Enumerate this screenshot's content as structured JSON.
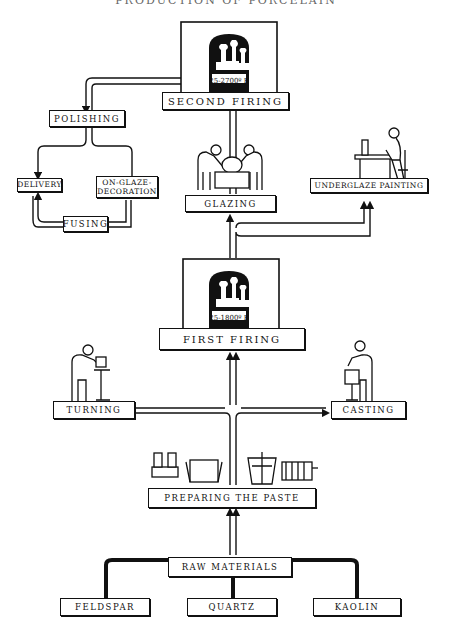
{
  "title": "PRODUCTION OF PORCELAIN",
  "colors": {
    "ink": "#111111",
    "background": "#ffffff"
  },
  "kilns": {
    "second": {
      "temperature": "25-2700º F",
      "label": "SECOND FIRING"
    },
    "first": {
      "temperature": "25-1800º F",
      "label": "FIRST FIRING"
    }
  },
  "steps": {
    "polishing": "POLISHING",
    "delivery": "DELIVERY",
    "on_glaze_line1": "ON-GLAZE-",
    "on_glaze_line2": "DECORATION",
    "fusing": "FUSING",
    "glazing": "GLAZING",
    "underglaze_painting": "UNDERGLAZE PAINTING",
    "turning": "TURNING",
    "casting": "CASTING",
    "preparing_paste": "PREPARING THE PASTE",
    "raw_materials": "RAW MATERIALS",
    "feldspar": "FELDSPAR",
    "quartz": "QUARTZ",
    "kaolin": "KAOLIN"
  },
  "icons": [
    "kiln-icon",
    "glazing-workers-icon",
    "painter-at-desk-icon",
    "potter-turning-icon",
    "caster-icon",
    "paste-machinery-icon"
  ]
}
